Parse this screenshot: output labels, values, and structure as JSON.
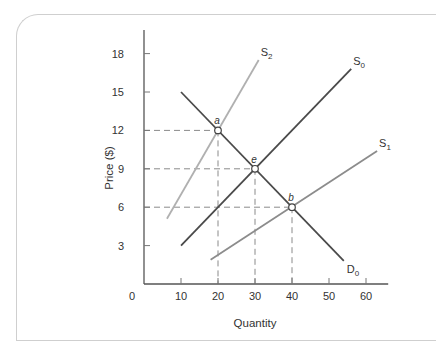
{
  "chart_data": {
    "type": "line",
    "title": "",
    "xlabel": "Quantity",
    "ylabel": "Price ($)",
    "xlim": [
      0,
      66
    ],
    "ylim": [
      0,
      20
    ],
    "x_ticks": [
      0,
      10,
      20,
      30,
      40,
      50,
      60
    ],
    "y_ticks": [
      3,
      6,
      9,
      12,
      15,
      18
    ],
    "grid": false,
    "legend": "inline labels at line ends",
    "series": [
      {
        "name": "D0",
        "label_main": "D",
        "label_sub": "0",
        "color": "#4a4a4a",
        "points": [
          [
            10,
            15
          ],
          [
            54,
            1.8
          ]
        ]
      },
      {
        "name": "S0",
        "label_main": "S",
        "label_sub": "0",
        "color": "#4a4a4a",
        "points": [
          [
            10,
            3
          ],
          [
            56,
            16.8
          ]
        ]
      },
      {
        "name": "S1",
        "label_main": "S",
        "label_sub": "1",
        "color": "#8c8c8c",
        "points": [
          [
            18,
            1.9
          ],
          [
            63,
            10.4
          ]
        ]
      },
      {
        "name": "S2",
        "label_main": "S",
        "label_sub": "2",
        "color": "#b0b0b0",
        "points": [
          [
            6.2,
            5.1
          ],
          [
            31,
            17.5
          ]
        ]
      }
    ],
    "annotations": [
      {
        "label": "a",
        "x": 20,
        "y": 12
      },
      {
        "label": "e",
        "x": 30,
        "y": 9
      },
      {
        "label": "b",
        "x": 40,
        "y": 6
      }
    ],
    "guide_lines": "dashed lines from each labeled point to both axes"
  }
}
